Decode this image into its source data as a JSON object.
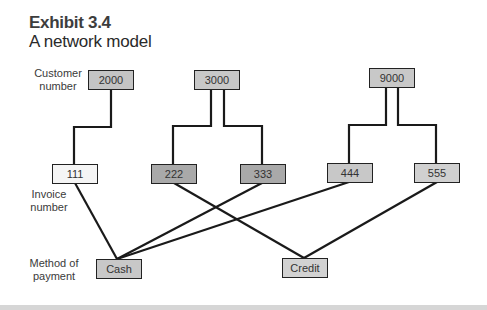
{
  "header": {
    "title": "Exhibit 3.4",
    "subtitle": "A network model"
  },
  "row_labels": {
    "customer": [
      "Customer",
      "number"
    ],
    "invoice": [
      "Invoice",
      "number"
    ],
    "payment": [
      "Method of",
      "payment"
    ]
  },
  "nodes": {
    "c2000": {
      "label": "2000",
      "fill": "#c4c4c4"
    },
    "c3000": {
      "label": "3000",
      "fill": "#c8c8c8"
    },
    "c9000": {
      "label": "9000",
      "fill": "#c8c8c8"
    },
    "i111": {
      "label": "111",
      "fill": "#f5f5f5"
    },
    "i222": {
      "label": "222",
      "fill": "#a9a9a9"
    },
    "i333": {
      "label": "333",
      "fill": "#a9a9a9"
    },
    "i444": {
      "label": "444",
      "fill": "#c8c8c8"
    },
    "i555": {
      "label": "555",
      "fill": "#d0d0d0"
    },
    "cash": {
      "label": "Cash",
      "fill": "#c8c8c8"
    },
    "credit": {
      "label": "Credit",
      "fill": "#d2d2d2"
    }
  },
  "edges": [
    {
      "from": "2000",
      "to": "111"
    },
    {
      "from": "3000",
      "to": "222"
    },
    {
      "from": "3000",
      "to": "333"
    },
    {
      "from": "9000",
      "to": "444"
    },
    {
      "from": "9000",
      "to": "555"
    },
    {
      "from": "111",
      "to": "Cash"
    },
    {
      "from": "333",
      "to": "Cash"
    },
    {
      "from": "444",
      "to": "Cash"
    },
    {
      "from": "222",
      "to": "Credit"
    },
    {
      "from": "555",
      "to": "Credit"
    }
  ]
}
